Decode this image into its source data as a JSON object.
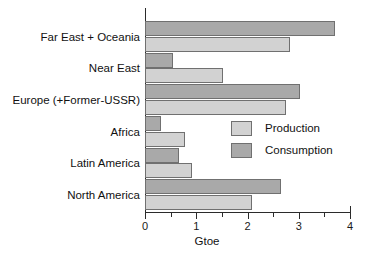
{
  "chart_data": {
    "type": "bar",
    "orientation": "horizontal",
    "title": "",
    "xlabel": "Gtoe",
    "ylabel": "",
    "xlim": [
      0,
      4
    ],
    "xticks": [
      0,
      1,
      2,
      3,
      4
    ],
    "xtick_labels": [
      "0",
      "1",
      "2",
      "3",
      "4"
    ],
    "minor_xticks": [
      0.5,
      1.5,
      2.5,
      3.5
    ],
    "grid": false,
    "legend_position": "center-right",
    "categories": [
      "Far East + Oceania",
      "Near East",
      "Europe (+Former-USSR)",
      "Africa",
      "Latin America",
      "North America"
    ],
    "series": [
      {
        "name": "Production",
        "color": "#d2d2d2",
        "values": [
          2.83,
          1.52,
          2.75,
          0.79,
          0.92,
          2.09
        ]
      },
      {
        "name": "Consumption",
        "color": "#a9a9a9",
        "values": [
          3.7,
          0.55,
          3.02,
          0.32,
          0.67,
          2.65
        ]
      }
    ]
  },
  "legend": {
    "items": [
      {
        "label": "Production",
        "swatch": "production"
      },
      {
        "label": "Consumption",
        "swatch": "consumption"
      }
    ]
  },
  "axis": {
    "x_title": "Gtoe"
  }
}
